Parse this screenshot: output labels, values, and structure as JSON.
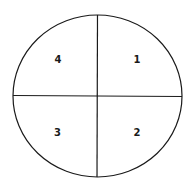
{
  "diagram": {
    "type": "quadrant-circle",
    "colors": {
      "stroke": "#1a1a1a",
      "background": "#ffffff"
    },
    "quadrants": [
      {
        "position": "top-right",
        "label": "1"
      },
      {
        "position": "bottom-right",
        "label": "2"
      },
      {
        "position": "bottom-left",
        "label": "3"
      },
      {
        "position": "top-left",
        "label": "4"
      }
    ]
  }
}
